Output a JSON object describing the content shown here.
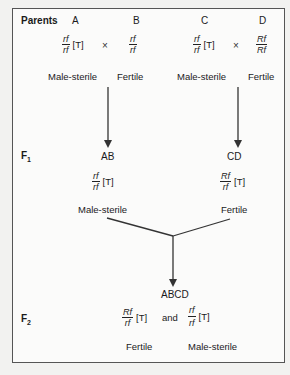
{
  "diagram": {
    "parents_label": "Parents",
    "f1_label": "F",
    "f1_sub": "1",
    "f2_label": "F",
    "f2_sub": "2",
    "cross_symbol": "×",
    "parents": [
      {
        "name": "A",
        "genotype_num": "rf",
        "genotype_den": "rf",
        "cytoplasm": "[T]",
        "phenotype": "Male-sterile"
      },
      {
        "name": "B",
        "genotype_num": "rf",
        "genotype_den": "rf",
        "cytoplasm": "",
        "phenotype": "Fertile"
      },
      {
        "name": "C",
        "genotype_num": "rf",
        "genotype_den": "rf",
        "cytoplasm": "[T]",
        "phenotype": "Male-sterile"
      },
      {
        "name": "D",
        "genotype_num": "Rf",
        "genotype_den": "Rf",
        "cytoplasm": "",
        "phenotype": "Fertile"
      }
    ],
    "f1": [
      {
        "name": "AB",
        "genotype_num": "rf",
        "genotype_den": "rf",
        "cytoplasm": "[T]",
        "phenotype": "Male-sterile"
      },
      {
        "name": "CD",
        "genotype_num": "Rf",
        "genotype_den": "rf",
        "cytoplasm": "[T]",
        "phenotype": "Fertile"
      }
    ],
    "f2": {
      "name": "ABCD",
      "and_label": "and",
      "offspring": [
        {
          "genotype_num": "Rf",
          "genotype_den": "rf",
          "cytoplasm": "[T]",
          "phenotype": "Fertile"
        },
        {
          "genotype_num": "rf",
          "genotype_den": "rf",
          "cytoplasm": "[T]",
          "phenotype": "Male-sterile"
        }
      ]
    },
    "colors": {
      "line": "#333333",
      "border": "#555555",
      "background": "#fbfbfa"
    }
  }
}
